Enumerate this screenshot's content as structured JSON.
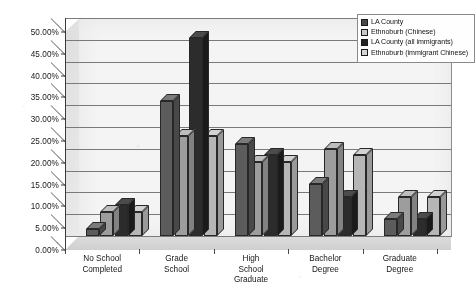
{
  "chart_data": {
    "type": "bar",
    "title": "",
    "xlabel": "",
    "ylabel": "",
    "ylim": [
      0,
      50
    ],
    "ytick_labels": [
      "0.00%",
      "5.00%",
      "10.00%",
      "15.00%",
      "20.00%",
      "25.00%",
      "30.00%",
      "35.00%",
      "40.00%",
      "45.00%",
      "50.00%"
    ],
    "ytick_values": [
      0,
      5,
      10,
      15,
      20,
      25,
      30,
      35,
      40,
      45,
      50
    ],
    "grid": true,
    "legend_position": "top-right",
    "style": "3d-grouped-bar",
    "categories": [
      "No School\nCompleted",
      "Grade\nSchool",
      "High\nSchool\nGraduate",
      "Bachelor\nDegree",
      "Graduate\nDegree"
    ],
    "series": [
      {
        "name": "LA County",
        "values": [
          1.5,
          31.0,
          21.0,
          12.0,
          4.0
        ]
      },
      {
        "name": "Ethnoburb (Chinese)",
        "values": [
          5.5,
          23.0,
          17.0,
          20.0,
          9.0
        ]
      },
      {
        "name": "LA County (all immigrants)",
        "values": [
          7.0,
          45.5,
          18.5,
          9.0,
          4.0
        ]
      },
      {
        "name": "Ethnoburb (immigrant Chinese)",
        "values": [
          5.5,
          23.0,
          17.0,
          18.5,
          9.0
        ]
      }
    ]
  },
  "legend": {
    "items": [
      {
        "label": "LA County",
        "swatch": "dark-grey"
      },
      {
        "label": "Ethnoburb (Chinese)",
        "swatch": "light-grey"
      },
      {
        "label": "LA County (all immigrants)",
        "swatch": "black"
      },
      {
        "label": "Ethnoburb (immigrant Chinese)",
        "swatch": "pale-grey"
      }
    ]
  }
}
